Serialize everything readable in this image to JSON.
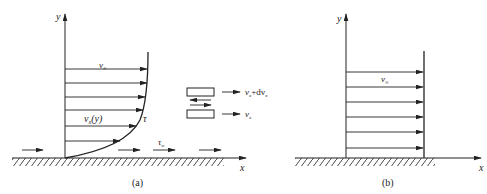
{
  "figure": {
    "panel_a": {
      "caption": "(a)",
      "axis_y_label": "y",
      "axis_x_label": "x",
      "free_stream_label": "v",
      "free_stream_sub": "∞",
      "profile_label": "v",
      "profile_label_sub": "x",
      "profile_label_suffix": "(y)",
      "shear_label": "τ",
      "wall_shear_label": "τ",
      "wall_shear_sub": "w",
      "element": {
        "upper_velocity_label": "v",
        "upper_velocity_sub": "x",
        "upper_velocity_plus": "+dv",
        "upper_velocity_plus_sub": "x",
        "lower_velocity_label": "v",
        "lower_velocity_sub": "x"
      }
    },
    "panel_b": {
      "caption": "(b)",
      "axis_y_label": "y",
      "axis_x_label": "x",
      "free_stream_label": "v",
      "free_stream_sub": "∞"
    },
    "colors": {
      "stroke": "#222222",
      "background": "#ffffff"
    }
  }
}
